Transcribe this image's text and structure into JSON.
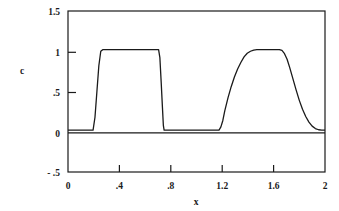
{
  "chart_data": {
    "type": "line",
    "title": "",
    "xlabel": "x",
    "ylabel": "c",
    "xlim": [
      0,
      2
    ],
    "ylim": [
      -0.5,
      1.5
    ],
    "grid": false,
    "legend": null,
    "x_ticks": [
      0,
      0.4,
      0.8,
      1.2,
      1.6,
      2
    ],
    "x_tick_labels": [
      "0",
      ".4",
      ".8",
      "1.2",
      "1.6",
      "2"
    ],
    "y_ticks": [
      -0.5,
      0,
      0.5,
      1,
      1.5
    ],
    "y_tick_labels": [
      "- .5",
      "0",
      ".5",
      "1",
      "1.5"
    ],
    "series": [
      {
        "name": "c",
        "description": "square pulse and smooth pulse profiles",
        "points": [
          [
            0.0,
            0.02
          ],
          [
            0.05,
            0.02
          ],
          [
            0.1,
            0.02
          ],
          [
            0.15,
            0.02
          ],
          [
            0.195,
            0.02
          ],
          [
            0.21,
            0.18
          ],
          [
            0.225,
            0.5
          ],
          [
            0.24,
            0.82
          ],
          [
            0.255,
            1.0
          ],
          [
            0.27,
            1.02
          ],
          [
            0.35,
            1.02
          ],
          [
            0.45,
            1.02
          ],
          [
            0.55,
            1.02
          ],
          [
            0.62,
            1.02
          ],
          [
            0.68,
            1.02
          ],
          [
            0.705,
            1.02
          ],
          [
            0.715,
            0.92
          ],
          [
            0.725,
            0.62
          ],
          [
            0.735,
            0.3
          ],
          [
            0.742,
            0.08
          ],
          [
            0.748,
            0.02
          ],
          [
            0.8,
            0.02
          ],
          [
            0.9,
            0.02
          ],
          [
            1.0,
            0.02
          ],
          [
            1.08,
            0.02
          ],
          [
            1.14,
            0.02
          ],
          [
            1.175,
            0.02
          ],
          [
            1.19,
            0.06
          ],
          [
            1.205,
            0.14
          ],
          [
            1.22,
            0.26
          ],
          [
            1.245,
            0.42
          ],
          [
            1.27,
            0.56
          ],
          [
            1.295,
            0.68
          ],
          [
            1.32,
            0.78
          ],
          [
            1.345,
            0.86
          ],
          [
            1.37,
            0.93
          ],
          [
            1.395,
            0.975
          ],
          [
            1.42,
            1.0
          ],
          [
            1.445,
            1.015
          ],
          [
            1.47,
            1.02
          ],
          [
            1.52,
            1.02
          ],
          [
            1.57,
            1.02
          ],
          [
            1.61,
            1.02
          ],
          [
            1.645,
            1.02
          ],
          [
            1.665,
            1.01
          ],
          [
            1.685,
            0.97
          ],
          [
            1.705,
            0.9
          ],
          [
            1.725,
            0.8
          ],
          [
            1.75,
            0.66
          ],
          [
            1.775,
            0.52
          ],
          [
            1.8,
            0.39
          ],
          [
            1.825,
            0.28
          ],
          [
            1.85,
            0.19
          ],
          [
            1.875,
            0.12
          ],
          [
            1.9,
            0.07
          ],
          [
            1.925,
            0.04
          ],
          [
            1.95,
            0.025
          ],
          [
            1.975,
            0.02
          ],
          [
            2.0,
            0.02
          ]
        ]
      }
    ]
  },
  "figure": {
    "background_color": "#ffffff",
    "line_color": "#1a1a1a",
    "text_color": "#1a1a1a"
  }
}
